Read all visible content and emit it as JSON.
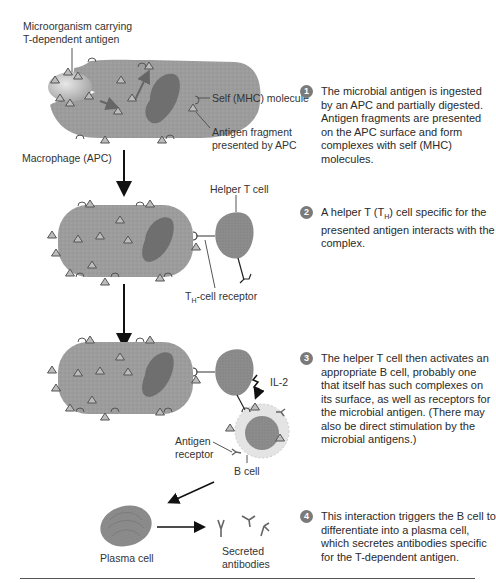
{
  "header_fragment": "…the B cell and helper T cell interactions…",
  "labels": {
    "microorganism": "Microorganism carrying",
    "microorganism_2": "T-dependent antigen",
    "self_mhc": "Self (MHC) molecule",
    "antigen_fragment": "Antigen fragment",
    "antigen_fragment_2": "presented by APC",
    "macrophage": "Macrophage (APC)",
    "helper_t_cell": "Helper T cell",
    "th_receptor_prefix": "T",
    "th_receptor_sub": "H",
    "th_receptor_suffix": "-cell receptor",
    "il2": "IL-2",
    "antigen_receptor": "Antigen",
    "antigen_receptor_2": "receptor",
    "b_cell": "B cell",
    "plasma_cell": "Plasma cell",
    "secreted": "Secreted",
    "secreted_2": "antibodies"
  },
  "steps": [
    {
      "num": "1",
      "text": "The microbial antigen is ingested by an APC and partially digested. Antigen fragments are presented on the APC surface and form complexes with self (MHC) molecules."
    },
    {
      "num": "2",
      "text_a": "A helper T (T",
      "text_sub": "H",
      "text_b": ") cell specific for the presented antigen interacts with the complex."
    },
    {
      "num": "3",
      "text": "The helper T cell then activates an appropriate B cell, probably one that itself has such complexes on its surface, as well as receptors for the microbial antigen. (There may also be direct stimulation by the microbial antigens.)"
    },
    {
      "num": "4",
      "text": "This interaction triggers the B cell to differentiate into a plasma cell, which secretes antibodies specific for the T-dependent antigen."
    }
  ],
  "colors": {
    "cell_fill": "#9a9a9a",
    "nucleus": "#6e6e6e",
    "bcell_halo": "#e2e2e2",
    "antigen_triangle": "#b5b5b5",
    "arrow": "#111111"
  }
}
